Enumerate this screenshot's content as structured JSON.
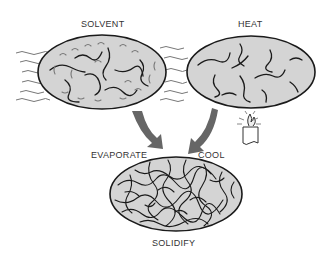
{
  "diagram": {
    "labels": {
      "solvent": "SOLVENT",
      "heat": "HEAT",
      "evaporate": "EVAPORATE",
      "cool": "COOL",
      "solidify": "SOLIDIFY"
    },
    "colors": {
      "fill": "#d4d4d4",
      "outline": "#1a1a1a",
      "arrow": "#666666",
      "text": "#333333"
    }
  }
}
